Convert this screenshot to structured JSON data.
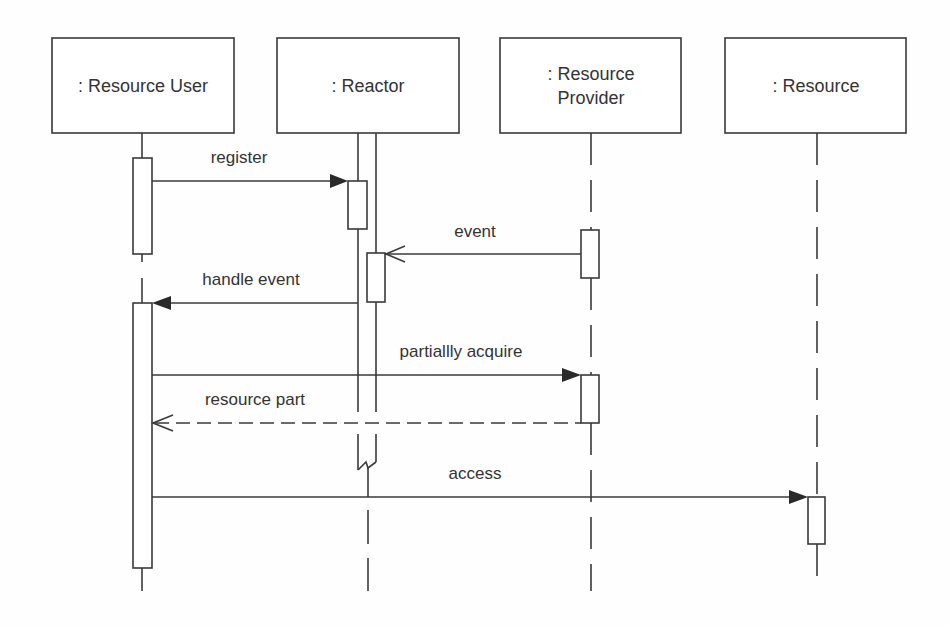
{
  "diagram": {
    "type": "UML sequence diagram",
    "colors": {
      "stroke": "#3a3a3a",
      "text": "#333333",
      "background": "#fefefe"
    },
    "participants": [
      {
        "id": "user",
        "label_lines": [
          ": Resource User"
        ]
      },
      {
        "id": "reactor",
        "label_lines": [
          ": Reactor"
        ],
        "active_object": true
      },
      {
        "id": "provider",
        "label_lines": [
          ": Resource",
          "Provider"
        ]
      },
      {
        "id": "resource",
        "label_lines": [
          ": Resource"
        ]
      }
    ],
    "messages": [
      {
        "label": "register",
        "from": "user",
        "to": "reactor",
        "kind": "synchronous"
      },
      {
        "label": "event",
        "from": "provider",
        "to": "reactor",
        "kind": "asynchronous"
      },
      {
        "label": "handle event",
        "from": "reactor",
        "to": "user",
        "kind": "synchronous"
      },
      {
        "label": "partiallly acquire",
        "from": "user",
        "to": "provider",
        "kind": "synchronous"
      },
      {
        "label": "resource part",
        "from": "provider",
        "to": "user",
        "kind": "return"
      },
      {
        "label": "access",
        "from": "user",
        "to": "resource",
        "kind": "synchronous"
      }
    ]
  }
}
